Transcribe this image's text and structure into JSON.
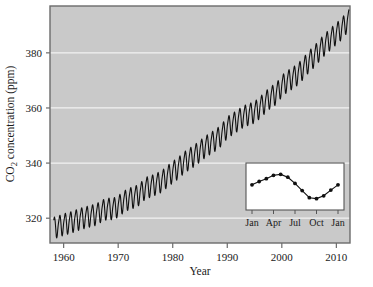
{
  "chart_data": {
    "type": "line",
    "title": "",
    "subtitle": "",
    "xlabel": "Year",
    "ylabel": "CO2 concentration (ppm)",
    "ylabel_display": "CO₂ concentration (ppm)",
    "xlim": [
      1957.5,
      2012.5
    ],
    "ylim": [
      311,
      397
    ],
    "xticks": [
      1960,
      1970,
      1980,
      1990,
      2000,
      2010
    ],
    "xtick_labels": [
      "1960",
      "1970",
      "1980",
      "1990",
      "2000",
      "2010"
    ],
    "yticks": [
      320,
      340,
      360,
      380
    ],
    "ytick_labels": [
      "320",
      "340",
      "360",
      "380"
    ],
    "grid": "horizontal-white-gridlines",
    "legend": "none",
    "plot_background_color": "#c9c9c9",
    "gridline_color": "#f2f2f2",
    "series_color": "#101010",
    "frame_color": "#6b6b6b",
    "series": [
      {
        "name": "Monthly mean CO2 (ppm)",
        "x": [
          1958.5,
          1959.0,
          1959.5,
          1960.0,
          1960.5,
          1961.0,
          1961.5,
          1962.0,
          1962.5,
          1963.0,
          1963.5,
          1964.0,
          1964.5,
          1965.0,
          1965.5,
          1966.0,
          1966.5,
          1967.0,
          1967.5,
          1968.0,
          1968.5,
          1969.0,
          1969.5,
          1970.0,
          1970.5,
          1971.0,
          1971.5,
          1972.0,
          1972.5,
          1973.0,
          1973.5,
          1974.0,
          1974.5,
          1975.0,
          1975.5,
          1976.0,
          1976.5,
          1977.0,
          1977.5,
          1978.0,
          1978.5,
          1979.0,
          1979.5,
          1980.0,
          1980.5,
          1981.0,
          1981.5,
          1982.0,
          1982.5,
          1983.0,
          1983.5,
          1984.0,
          1984.5,
          1985.0,
          1985.5,
          1986.0,
          1986.5,
          1987.0,
          1987.5,
          1988.0,
          1988.5,
          1989.0,
          1989.5,
          1990.0,
          1990.5,
          1991.0,
          1991.5,
          1992.0,
          1992.5,
          1993.0,
          1993.5,
          1994.0,
          1994.5,
          1995.0,
          1995.5,
          1996.0,
          1996.5,
          1997.0,
          1997.5,
          1998.0,
          1998.5,
          1999.0,
          1999.5,
          2000.0,
          2000.5,
          2001.0,
          2001.5,
          2002.0,
          2002.5,
          2003.0,
          2003.5,
          2004.0,
          2004.5,
          2005.0,
          2005.5,
          2006.0,
          2006.5,
          2007.0,
          2007.5,
          2008.0,
          2008.5,
          2009.0,
          2009.5,
          2010.0,
          2010.5,
          2011.0,
          2011.5,
          2012.0
        ],
        "annual_mean_values": [
          315.0,
          315.6,
          316.4,
          316.9,
          317.6,
          318.4,
          318.9,
          319.5,
          320.0,
          321.3,
          322.1,
          322.0,
          322.9,
          324.6,
          325.7,
          326.3,
          327.4,
          329.6,
          330.2,
          331.1,
          332.0,
          333.8,
          335.4,
          336.8,
          338.7,
          340.1,
          341.4,
          343.0,
          344.6,
          345.9,
          347.2,
          348.9,
          351.6,
          352.9,
          354.2,
          355.6,
          356.4,
          357.1,
          358.8,
          360.8,
          362.6,
          363.8,
          366.6,
          368.3,
          369.5,
          371.0,
          373.1,
          375.6,
          377.4,
          379.8,
          381.9,
          383.8,
          385.6,
          387.4,
          389.9,
          391.6,
          393.8,
          396.5
        ],
        "seasonal_amplitude_ppm": 6.0
      }
    ],
    "inset": {
      "type": "line",
      "description": "Average seasonal cycle of CO2 over one year",
      "xlabel": "",
      "ylabel": "",
      "xtick_labels": [
        "Jan",
        "Apr",
        "Jul",
        "Oct",
        "Jan"
      ],
      "xticks": [
        1,
        4,
        7,
        10,
        13
      ],
      "months": [
        "Jan",
        "Feb",
        "Mar",
        "Apr",
        "May",
        "Jun",
        "Jul",
        "Aug",
        "Sep",
        "Oct",
        "Nov",
        "Dec",
        "Jan"
      ],
      "values": [
        1.2,
        1.9,
        2.5,
        3.2,
        3.4,
        2.8,
        1.5,
        0.0,
        -1.5,
        -1.7,
        -1.1,
        0.1,
        1.2
      ],
      "background_color": "#ffffff",
      "frame_color": "#555555",
      "marker": "filled-circle",
      "marker_color": "#101010",
      "line_color": "#101010"
    }
  }
}
